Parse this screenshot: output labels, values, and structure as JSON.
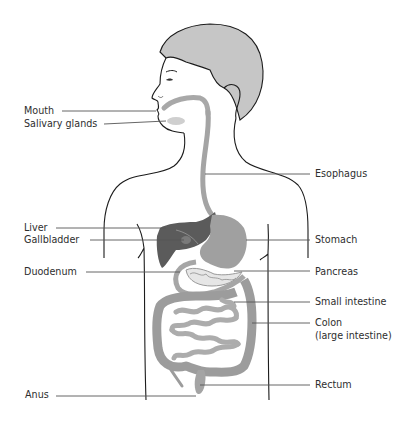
{
  "diagram": {
    "type": "anatomical-illustration",
    "colors": {
      "outline": "#1c1c1c",
      "hair": "#c4c4c4",
      "liver": "#5a5a5a",
      "stomach": "#9d9d9d",
      "intestine": "#a9a9a9",
      "colon": "#9a9a9a",
      "leader_line": "#555555",
      "text": "#2e2e2e"
    },
    "labels_left": [
      {
        "id": "mouth",
        "text": "Mouth"
      },
      {
        "id": "salivary-glands",
        "text": "Salivary glands"
      },
      {
        "id": "liver",
        "text": "Liver"
      },
      {
        "id": "gallbladder",
        "text": "Gallbladder"
      },
      {
        "id": "duodenum",
        "text": "Duodenum"
      },
      {
        "id": "anus",
        "text": "Anus"
      }
    ],
    "labels_right": [
      {
        "id": "esophagus",
        "text": "Esophagus"
      },
      {
        "id": "stomach",
        "text": "Stomach"
      },
      {
        "id": "pancreas",
        "text": "Pancreas"
      },
      {
        "id": "small-intestine",
        "text": "Small intestine"
      },
      {
        "id": "colon",
        "text": "Colon",
        "subtext": "(large intestine)"
      },
      {
        "id": "rectum",
        "text": "Rectum"
      }
    ]
  }
}
